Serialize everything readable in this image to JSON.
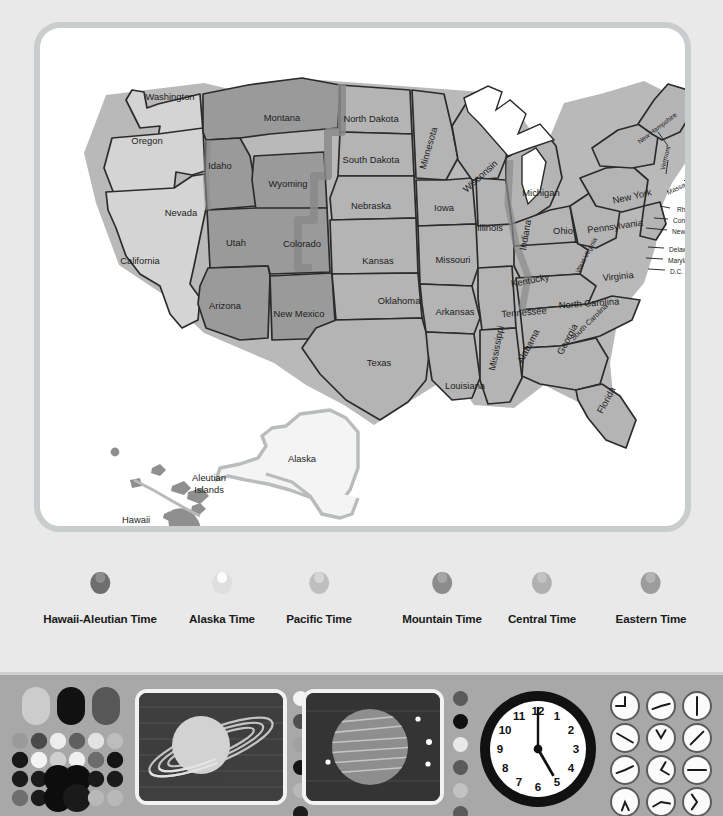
{
  "map": {
    "title": "United States Time Zones Map",
    "zone_colors": {
      "pacific": "#d4d4d4",
      "mountain": "#9a9a9a",
      "central": "#b4b4b4",
      "eastern": "#b4b4b4",
      "alaska": "#f0f0f0",
      "hawaii": "#8f8f8f",
      "lakes": "#ffffff",
      "outline": "#2b2b2b",
      "boundary_band": "#8a8a8a",
      "card_border": "#c9cdcd",
      "background": "#e9e9e9"
    },
    "states": [
      {
        "name": "Washington",
        "x": 130,
        "y": 68,
        "rot": 0,
        "size": "n"
      },
      {
        "name": "Oregon",
        "x": 107,
        "y": 112,
        "rot": 0,
        "size": "n"
      },
      {
        "name": "California",
        "x": 100,
        "y": 232,
        "rot": 0,
        "size": "n"
      },
      {
        "name": "Nevada",
        "x": 141,
        "y": 184,
        "rot": 0,
        "size": "n"
      },
      {
        "name": "Idaho",
        "x": 180,
        "y": 137,
        "rot": 0,
        "size": "n"
      },
      {
        "name": "Montana",
        "x": 242,
        "y": 89,
        "rot": 0,
        "size": "n"
      },
      {
        "name": "Wyoming",
        "x": 248,
        "y": 155,
        "rot": 0,
        "size": "n"
      },
      {
        "name": "Utah",
        "x": 196,
        "y": 214,
        "rot": 0,
        "size": "n"
      },
      {
        "name": "Colorado",
        "x": 262,
        "y": 215,
        "rot": 0,
        "size": "n"
      },
      {
        "name": "Arizona",
        "x": 185,
        "y": 277,
        "rot": 0,
        "size": "n"
      },
      {
        "name": "New Mexico",
        "x": 259,
        "y": 285,
        "rot": 0,
        "size": "n"
      },
      {
        "name": "North Dakota",
        "x": 331,
        "y": 90,
        "rot": 0,
        "size": "n"
      },
      {
        "name": "South Dakota",
        "x": 331,
        "y": 131,
        "rot": 0,
        "size": "n"
      },
      {
        "name": "Nebraska",
        "x": 331,
        "y": 177,
        "rot": 0,
        "size": "n"
      },
      {
        "name": "Kansas",
        "x": 338,
        "y": 232,
        "rot": 0,
        "size": "n"
      },
      {
        "name": "Oklahoma",
        "x": 359,
        "y": 272,
        "rot": 0,
        "size": "n"
      },
      {
        "name": "Texas",
        "x": 339,
        "y": 334,
        "rot": 0,
        "size": "n"
      },
      {
        "name": "Minnesota",
        "x": 388,
        "y": 120,
        "rot": -74,
        "size": "n"
      },
      {
        "name": "Iowa",
        "x": 404,
        "y": 179,
        "rot": 0,
        "size": "n"
      },
      {
        "name": "Missouri",
        "x": 413,
        "y": 231,
        "rot": 0,
        "size": "n"
      },
      {
        "name": "Arkansas",
        "x": 415,
        "y": 283,
        "rot": 0,
        "size": "n"
      },
      {
        "name": "Louisiana",
        "x": 425,
        "y": 357,
        "rot": 0,
        "size": "n"
      },
      {
        "name": "Wisconsin",
        "x": 440,
        "y": 148,
        "rot": -42,
        "size": "n"
      },
      {
        "name": "Illinois",
        "x": 450,
        "y": 199,
        "rot": 0,
        "size": "n"
      },
      {
        "name": "Mississippi",
        "x": 456,
        "y": 320,
        "rot": -79,
        "size": "n"
      },
      {
        "name": "Michigan",
        "x": 501,
        "y": 164,
        "rot": 0,
        "size": "n"
      },
      {
        "name": "Indiana",
        "x": 485,
        "y": 207,
        "rot": -80,
        "size": "n"
      },
      {
        "name": "Ohio",
        "x": 523,
        "y": 202,
        "rot": 0,
        "size": "n"
      },
      {
        "name": "Kentucky",
        "x": 490,
        "y": 252,
        "rot": -11,
        "size": "n"
      },
      {
        "name": "Tennessee",
        "x": 484,
        "y": 284,
        "rot": -5,
        "size": "n"
      },
      {
        "name": "Alabama",
        "x": 488,
        "y": 318,
        "rot": -62,
        "size": "n"
      },
      {
        "name": "Georgia",
        "x": 527,
        "y": 311,
        "rot": -62,
        "size": "n"
      },
      {
        "name": "Florida",
        "x": 566,
        "y": 372,
        "rot": -62,
        "size": "n"
      },
      {
        "name": "South Carolina",
        "x": 549,
        "y": 294,
        "rot": -45,
        "size": "sm"
      },
      {
        "name": "North Carolina",
        "x": 549,
        "y": 275,
        "rot": -4,
        "size": "n"
      },
      {
        "name": "Virginia",
        "x": 578,
        "y": 248,
        "rot": -6,
        "size": "n"
      },
      {
        "name": "West Virginia",
        "x": 546,
        "y": 227,
        "rot": -62,
        "size": "xs"
      },
      {
        "name": "Pennsylvania",
        "x": 575,
        "y": 198,
        "rot": -8,
        "size": "n"
      },
      {
        "name": "New York",
        "x": 592,
        "y": 168,
        "rot": -13,
        "size": "n"
      },
      {
        "name": "Maine",
        "x": 657,
        "y": 109,
        "rot": -33,
        "size": "n"
      },
      {
        "name": "New Hampshire",
        "x": 617,
        "y": 100,
        "rot": -37,
        "size": "xs"
      },
      {
        "name": "Vermont",
        "x": 625,
        "y": 130,
        "rot": -76,
        "size": "xs"
      },
      {
        "name": "Massachusetts",
        "x": 647,
        "y": 155,
        "rot": -26,
        "size": "xs"
      }
    ],
    "callout_labels": [
      {
        "name": "Rhode Island",
        "x": 637,
        "y": 181
      },
      {
        "name": "Connecticut",
        "x": 633,
        "y": 192
      },
      {
        "name": "New Jersey",
        "x": 632,
        "y": 203
      },
      {
        "name": "Delaware",
        "x": 629,
        "y": 221
      },
      {
        "name": "Maryland",
        "x": 628,
        "y": 232
      },
      {
        "name": "D.C.",
        "x": 630,
        "y": 243
      }
    ],
    "inset_labels": [
      {
        "name": "Alaska",
        "x": 262,
        "y": 430
      },
      {
        "name": "Aleutian Islands",
        "x": 169,
        "y": 449
      },
      {
        "name": "Hawaii",
        "x": 96,
        "y": 491
      }
    ]
  },
  "legend": {
    "items": [
      {
        "label": "Hawaii-Aleutian Time",
        "x": 100,
        "ring": "#6e6e6e",
        "fill": "#8d8d8d"
      },
      {
        "label": "Alaska Time",
        "x": 222,
        "ring": "#dedede",
        "fill": "#fcfcfc"
      },
      {
        "label": "Pacific Time",
        "x": 319,
        "ring": "#bfbfbf",
        "fill": "#d6d6d6"
      },
      {
        "label": "Mountain Time",
        "x": 442,
        "ring": "#8c8c8c",
        "fill": "#a6a6a6"
      },
      {
        "label": "Central Time",
        "x": 542,
        "ring": "#b0b0b0",
        "fill": "#c4c4c4"
      },
      {
        "label": "Eastern Time",
        "x": 651,
        "ring": "#9c9c9c",
        "fill": "#b4b4b4"
      }
    ]
  },
  "toolbar": {
    "background": "#a8a8a8",
    "swatch_grid": {
      "name": "color-swatch-grid",
      "pills": [
        "#cccccc",
        "#111111",
        "#575757"
      ],
      "rows": [
        [
          "#9a9a9a",
          "#4a4a4a",
          "#ededed",
          "#5f5f5f",
          "#e2e2e2",
          "#bdbdbd"
        ],
        [
          "#171717",
          "#f3f3f3",
          "#cfcfcf",
          "#f0f0f0",
          "#6b6b6b",
          "#141414"
        ],
        [
          "#1a1a1a",
          "#1a1a1a",
          "#0d0d0d",
          "#0d0d0d",
          "#1a1a1a",
          "#1a1a1a"
        ],
        [
          "#6e6e6e",
          "#1a1a1a",
          "#0d0d0d",
          "#1a1a1a",
          "#b8b8b8",
          "#b8b8b8"
        ]
      ]
    },
    "saturn_screen": {
      "name": "saturn-thumbnail",
      "planet": "#d2d2d2",
      "ring": "#e2e2e2",
      "sky": "#3f3f3f"
    },
    "jupiter_screen": {
      "name": "jupiter-thumbnail",
      "planet": "#8e8e8e",
      "band": "#d8d8d8",
      "sky": "#343434",
      "moons": 4
    },
    "dot_strip_left": [
      "#f4f4f4",
      "#4f4f4f",
      "#a0a0a0",
      "#141414",
      "#b9b9b9",
      "#1c1c1c"
    ],
    "dot_strip_right": [
      "#5a5a5a",
      "#101010",
      "#e8e8e8",
      "#5a5a5a",
      "#c2c2c2",
      "#5a5a5a"
    ],
    "clock": {
      "name": "analog-clock",
      "hour_numbers": [
        "12",
        "1",
        "2",
        "3",
        "4",
        "5",
        "6",
        "7",
        "8",
        "9",
        "10",
        "11"
      ],
      "minute_hand_deg": 0,
      "hour_hand_deg": 150,
      "face": "#ffffff",
      "bezel": "#111111"
    },
    "clock_grid": {
      "name": "clock-icon-grid",
      "icons": [
        {
          "a1": 270,
          "a2": 0,
          "shape": "L"
        },
        {
          "a1": 250,
          "a2": 75,
          "shape": "bent"
        },
        {
          "a1": 0,
          "a2": 180,
          "shape": "line"
        },
        {
          "a1": 300,
          "a2": 120,
          "shape": "bent"
        },
        {
          "a1": 330,
          "a2": 30,
          "shape": "V"
        },
        {
          "a1": 45,
          "a2": 225,
          "shape": "arrow"
        },
        {
          "a1": 65,
          "a2": 250,
          "shape": "thin"
        },
        {
          "a1": 120,
          "a2": 30,
          "shape": "hook"
        },
        {
          "a1": 90,
          "a2": 270,
          "shape": "line"
        },
        {
          "a1": 155,
          "a2": 200,
          "shape": "V"
        },
        {
          "a1": 240,
          "a2": 100,
          "shape": "bent"
        },
        {
          "a1": 215,
          "a2": 325,
          "shape": "arc"
        }
      ]
    }
  }
}
